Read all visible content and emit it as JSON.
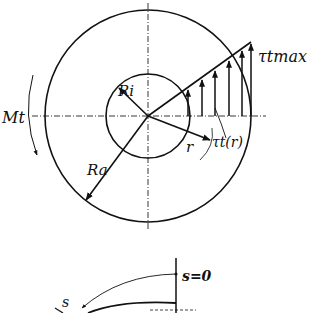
{
  "diagram": {
    "labels": {
      "inner_radius": "Ri",
      "outer_radius": "Ra",
      "torque": "Mt",
      "radius_var": "r",
      "shear_max": "τtmax",
      "shear_r": "τt(r)",
      "arc_coord": "s",
      "arc_origin": "s=0"
    },
    "geometry": {
      "center": [
        148,
        116
      ],
      "outer_radius_px": 104,
      "inner_radius_px": 42,
      "stress_arrows": 7
    },
    "colors": {
      "ink": "#111111",
      "background": "#ffffff"
    }
  }
}
